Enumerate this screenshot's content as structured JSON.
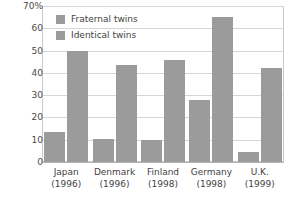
{
  "chart_data": {
    "type": "bar",
    "title": "",
    "subtitle": "",
    "xlabel": "",
    "ylabel": "",
    "ylim": [
      0,
      70
    ],
    "yticks": [
      0,
      10,
      20,
      30,
      40,
      50,
      60,
      70
    ],
    "ytick_labels": [
      "0",
      "10",
      "20",
      "30",
      "40",
      "50",
      "60",
      "70%"
    ],
    "grid": true,
    "legend_position": "top-left",
    "categories": [
      "Japan",
      "Denmark",
      "Finland",
      "Germany",
      "U.K."
    ],
    "category_sublabels": [
      "(1996)",
      "(1996)",
      "(1998)",
      "(1998)",
      "(1999)"
    ],
    "series": [
      {
        "name": "Fraternal twins",
        "color": "#9b9b9b",
        "values": [
          13.5,
          10.5,
          10,
          28,
          4.5
        ]
      },
      {
        "name": "Identical twins",
        "color": "#9b9b9b",
        "values": [
          50,
          43.5,
          46,
          65,
          42
        ]
      }
    ]
  },
  "colors": {
    "bar": "#9b9b9b",
    "grid": "#d6d6d6",
    "frame": "#c9c9c9",
    "text": "#3f3f3f",
    "background": "#ffffff"
  }
}
